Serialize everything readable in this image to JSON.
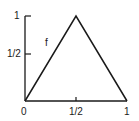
{
  "chart_data": {
    "type": "line",
    "title": "",
    "xlabel": "",
    "ylabel": "",
    "xlim": [
      0,
      1
    ],
    "ylim": [
      0,
      1
    ],
    "grid": false,
    "legend": null,
    "series": [
      {
        "name": "f",
        "x": [
          0,
          0.5,
          1
        ],
        "y": [
          0,
          1,
          0
        ]
      }
    ],
    "x_ticks": [
      {
        "value": 0,
        "label": "0"
      },
      {
        "value": 0.5,
        "label": "1/2"
      },
      {
        "value": 1,
        "label": "1"
      }
    ],
    "y_ticks": [
      {
        "value": 0.5,
        "label": "1/2"
      },
      {
        "value": 1,
        "label": "1"
      }
    ],
    "annotations": [
      {
        "text": "f",
        "x": 0.22,
        "y": 0.66
      }
    ]
  },
  "colors": {
    "line": "#1a1a1a",
    "background": "#ffffff"
  }
}
